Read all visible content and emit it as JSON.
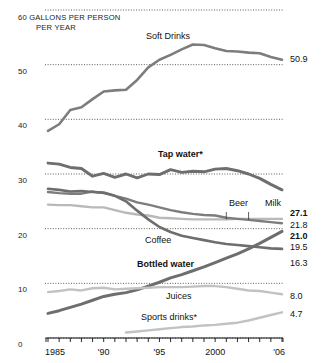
{
  "header": {
    "line1": "60  GALLONS PER PERSON",
    "line2": "PER YEAR"
  },
  "chart_data": {
    "type": "line",
    "xlabel": "",
    "ylabel": "GALLONS PER PERSON PER YEAR",
    "xlim": [
      1985,
      2006
    ],
    "ylim": [
      0,
      60
    ],
    "grid": true,
    "legend": "inline-labels",
    "x_tick_labels": [
      "1985",
      "'90",
      "'95",
      "2000",
      "'06"
    ],
    "x_tick_values": [
      1985,
      1990,
      1995,
      2000,
      2006
    ],
    "y_tick_labels": [
      "0",
      "10",
      "20",
      "30",
      "40",
      "50",
      "60"
    ],
    "y_tick_values": [
      0,
      10,
      20,
      30,
      40,
      50,
      60
    ],
    "x": [
      1985,
      1986,
      1987,
      1988,
      1989,
      1990,
      1991,
      1992,
      1993,
      1994,
      1995,
      1996,
      1997,
      1998,
      1999,
      2000,
      2001,
      2002,
      2003,
      2004,
      2005,
      2006
    ],
    "series": [
      {
        "name": "Soft Drinks",
        "label": "Soft Drinks",
        "label_bold": false,
        "end_value": 50.9,
        "end_value_bold": false,
        "color": "#7d7d7d",
        "width": 2.6,
        "values": [
          37.9,
          39.1,
          41.7,
          42.2,
          43.7,
          45.1,
          45.3,
          45.4,
          47.2,
          49.5,
          50.9,
          51.8,
          52.8,
          53.7,
          53.6,
          53.0,
          52.5,
          52.4,
          52.2,
          52.1,
          51.4,
          50.9
        ]
      },
      {
        "name": "Tap water",
        "label": "Tap water*",
        "label_bold": true,
        "end_value": 27.1,
        "end_value_bold": true,
        "color": "#6e6e6e",
        "width": 2.9,
        "values": [
          32.0,
          31.8,
          31.2,
          31.0,
          29.6,
          30.1,
          29.4,
          30.0,
          29.3,
          30.0,
          29.9,
          30.8,
          30.3,
          30.5,
          30.4,
          30.9,
          31.0,
          30.6,
          30.0,
          29.2,
          28.1,
          27.1
        ]
      },
      {
        "name": "Beer",
        "label": "Beer",
        "label_bold": false,
        "end_value": 21.8,
        "end_value_bold": false,
        "color": "#b9b9b9",
        "width": 2.4,
        "values": [
          24.4,
          24.3,
          24.3,
          24.1,
          23.9,
          23.9,
          23.4,
          22.9,
          22.6,
          22.4,
          22.0,
          21.9,
          21.8,
          21.7,
          21.7,
          21.7,
          21.7,
          21.8,
          21.8,
          21.8,
          21.8,
          21.8
        ]
      },
      {
        "name": "Milk",
        "label": "Milk",
        "label_bold": false,
        "end_value": 21.0,
        "end_value_bold": true,
        "color": "#7d7d7d",
        "width": 2.4,
        "values": [
          26.7,
          26.5,
          26.4,
          26.4,
          26.8,
          26.5,
          26.0,
          25.5,
          24.8,
          24.4,
          23.9,
          23.4,
          23.0,
          22.7,
          22.5,
          22.4,
          22.0,
          21.8,
          21.6,
          21.4,
          21.2,
          21.0
        ]
      },
      {
        "name": "Coffee",
        "label": "Coffee",
        "label_bold": false,
        "end_value": 16.3,
        "end_value_bold": false,
        "color": "#6e6e6e",
        "width": 2.6,
        "values": [
          27.3,
          27.1,
          26.8,
          26.9,
          26.7,
          26.6,
          26.0,
          25.0,
          23.3,
          21.7,
          20.3,
          19.4,
          18.7,
          18.3,
          17.9,
          17.5,
          17.2,
          17.0,
          16.8,
          16.6,
          16.4,
          16.3
        ]
      },
      {
        "name": "Bottled water",
        "label": "Bottled water",
        "label_bold": true,
        "end_value": 19.5,
        "end_value_bold": false,
        "color": "#6e6e6e",
        "width": 3.0,
        "values": [
          4.5,
          5.0,
          5.6,
          6.2,
          6.9,
          7.6,
          8.0,
          8.3,
          8.8,
          9.5,
          10.2,
          11.0,
          11.6,
          12.3,
          13.0,
          13.8,
          14.6,
          15.4,
          16.3,
          17.3,
          18.4,
          19.5
        ]
      },
      {
        "name": "Juices",
        "label": "Juices",
        "label_bold": false,
        "end_value": 8.0,
        "end_value_bold": false,
        "color": "#c2c2c2",
        "width": 2.4,
        "values": [
          8.4,
          8.6,
          8.9,
          8.7,
          9.1,
          9.2,
          8.9,
          9.0,
          9.1,
          9.2,
          9.3,
          9.3,
          9.3,
          9.4,
          9.5,
          9.5,
          9.3,
          9.0,
          8.7,
          8.6,
          8.3,
          8.0
        ]
      },
      {
        "name": "Sports drinks",
        "label": "Sports drinks*",
        "label_bold": false,
        "end_value": 4.7,
        "end_value_bold": false,
        "color": "#c2c2c2",
        "width": 2.4,
        "values": [
          null,
          null,
          null,
          null,
          null,
          null,
          null,
          1.0,
          1.2,
          1.4,
          1.6,
          1.8,
          2.0,
          2.1,
          2.3,
          2.4,
          2.6,
          2.8,
          3.2,
          3.7,
          4.2,
          4.7
        ]
      }
    ],
    "inline_labels": [
      {
        "name": "soft-drinks",
        "text": "Soft Drinks",
        "x": 146,
        "y": 39,
        "bold": false
      },
      {
        "name": "tap-water",
        "text": "Tap water*",
        "x": 158,
        "y": 157,
        "bold": true
      },
      {
        "name": "beer",
        "text": "Beer",
        "x": 229,
        "y": 206,
        "bold": false
      },
      {
        "name": "milk",
        "text": "Milk",
        "x": 265,
        "y": 206,
        "bold": false
      },
      {
        "name": "coffee",
        "text": "Coffee",
        "x": 145,
        "y": 243,
        "bold": false
      },
      {
        "name": "bottled-water",
        "text": "Bottled water",
        "x": 137,
        "y": 267,
        "bold": true
      },
      {
        "name": "juices",
        "text": "Juices",
        "x": 166,
        "y": 299,
        "bold": false
      },
      {
        "name": "sports-drinks",
        "text": "Sports drinks*",
        "x": 141,
        "y": 320,
        "bold": false
      }
    ],
    "end_values": [
      {
        "name": "soft-drinks",
        "text": "50.9",
        "x": 290,
        "y": 62,
        "bold": false
      },
      {
        "name": "tap-water",
        "text": "27.1",
        "x": 290,
        "y": 216,
        "bold": true
      },
      {
        "name": "beer",
        "text": "21.8",
        "x": 290,
        "y": 228,
        "bold": false
      },
      {
        "name": "milk",
        "text": "21.0",
        "x": 290,
        "y": 239,
        "bold": true
      },
      {
        "name": "bottled-water",
        "text": "19.5",
        "x": 290,
        "y": 250,
        "bold": false
      },
      {
        "name": "coffee",
        "text": "16.3",
        "x": 290,
        "y": 266,
        "bold": false
      },
      {
        "name": "juices",
        "text": "8.0",
        "x": 290,
        "y": 299,
        "bold": false
      },
      {
        "name": "sports-drinks",
        "text": "4.7",
        "x": 290,
        "y": 317,
        "bold": false
      }
    ]
  }
}
